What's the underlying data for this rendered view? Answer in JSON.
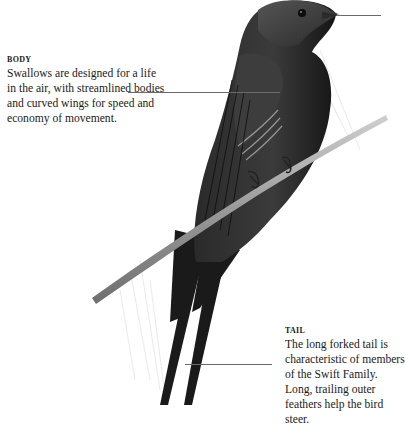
{
  "callouts": {
    "body": {
      "heading": "BODY",
      "text": "Swallows are designed for a life in the air, with streamlined bodies and curved wings for speed and economy of movement."
    },
    "tail": {
      "heading": "TAIL",
      "text": "The long forked tail is characteristic of members of the Swift Family. Long, trailing outer feathers help the bird steer."
    }
  },
  "illustration": {
    "subject": "swallow perched on a twig",
    "colors": {
      "plumage": "#1e1e1e",
      "plumage_highlight": "#4a4a4a",
      "branch": "#a8a8a8",
      "leader_line": "#6a6a6a"
    }
  }
}
